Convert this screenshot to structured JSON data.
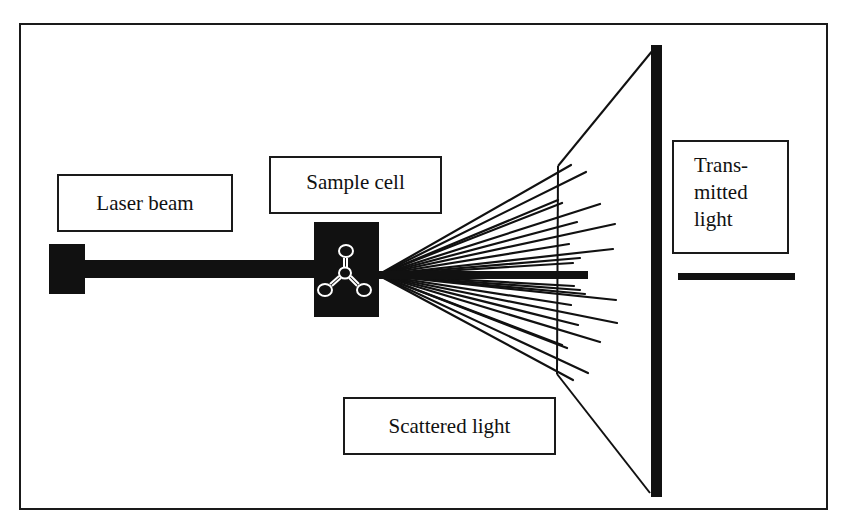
{
  "diagram": {
    "type": "light-scattering-setup",
    "labels": {
      "laser_beam": "Laser beam",
      "sample_cell": "Sample cell",
      "scattered_light": "Scattered light",
      "transmitted_light_lines": [
        "Trans-",
        "mitted",
        "light"
      ]
    },
    "components": [
      {
        "id": "laser-source",
        "shape": "filled-square"
      },
      {
        "id": "laser-beam",
        "shape": "thick-horizontal-bar"
      },
      {
        "id": "sample-cell",
        "shape": "filled-rectangle",
        "icon": "molecule-icon"
      },
      {
        "id": "scattered-rays",
        "shape": "fan-of-lines"
      },
      {
        "id": "detector-screen",
        "shape": "thick-vertical-bar"
      },
      {
        "id": "transmitted-beam",
        "shape": "thick-horizontal-bar"
      }
    ],
    "colors": {
      "ink": "#111111",
      "background": "#ffffff"
    }
  }
}
